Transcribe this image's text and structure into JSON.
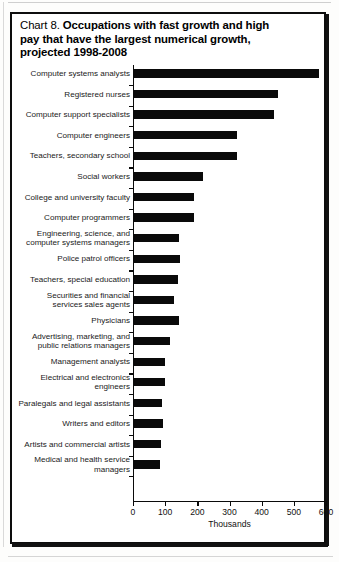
{
  "figure": {
    "chart_number": "Chart 8.",
    "title_lines": [
      "Occupations with fast growth and high",
      "pay that have the largest numerical growth,",
      "projected 1998-2008"
    ],
    "title_full": "Chart 8.  Occupations with fast growth and high pay that have the largest numerical growth, projected 1998-2008"
  },
  "chart_data": {
    "type": "bar",
    "orientation": "horizontal",
    "title": "Occupations with fast growth and high pay that have the largest numerical growth, projected 1998-2008",
    "xlabel": "Thousands",
    "ylabel": "",
    "xlim": [
      0,
      600
    ],
    "xticks": [
      0,
      100,
      200,
      300,
      400,
      500,
      600
    ],
    "xtick_labels": [
      "0",
      "100",
      "200",
      "300",
      "400",
      "500",
      "600"
    ],
    "grid": false,
    "legend": null,
    "bar_color": "#0a0a0a",
    "categories": [
      "Computer systems analysts",
      "Registered nurses",
      "Computer support specialists",
      "Computer engineers",
      "Teachers, secondary school",
      "Social workers",
      "College and university faculty",
      "Computer programmers",
      "Engineering, science, and\ncomputer systems managers",
      "Police patrol officers",
      "Teachers, special education",
      "Securities and financial\nservices sales agents",
      "Physicians",
      "Advertising, marketing, and\npublic relations managers",
      "Management analysts",
      "Electrical and electronics\nengineers",
      "Paralegals and legal assistants",
      "Writers and editors",
      "Artists and commercial artists",
      "Medical and health service\nmanagers"
    ],
    "values": [
      577,
      451,
      439,
      323,
      322,
      217,
      190,
      191,
      144,
      147,
      141,
      129,
      142,
      115,
      101,
      98,
      91,
      92,
      88,
      84
    ]
  },
  "rows": [
    {
      "label": "Computer systems analysts",
      "value": 577,
      "lines": 1
    },
    {
      "label": "Registered nurses",
      "value": 451,
      "lines": 1
    },
    {
      "label": "Computer support specialists",
      "value": 439,
      "lines": 1
    },
    {
      "label": "Computer engineers",
      "value": 323,
      "lines": 1
    },
    {
      "label": "Teachers, secondary school",
      "value": 322,
      "lines": 1
    },
    {
      "label": "Social workers",
      "value": 217,
      "lines": 1
    },
    {
      "label": "College and university faculty",
      "value": 190,
      "lines": 1
    },
    {
      "label": "Computer programmers",
      "value": 191,
      "lines": 1
    },
    {
      "label": "Engineering, science, and\ncomputer systems managers",
      "value": 144,
      "lines": 2
    },
    {
      "label": "Police patrol officers",
      "value": 147,
      "lines": 1
    },
    {
      "label": "Teachers, special education",
      "value": 141,
      "lines": 1
    },
    {
      "label": "Securities and financial\nservices sales agents",
      "value": 129,
      "lines": 2
    },
    {
      "label": "Physicians",
      "value": 142,
      "lines": 1
    },
    {
      "label": "Advertising, marketing, and\npublic relations managers",
      "value": 115,
      "lines": 2
    },
    {
      "label": "Management analysts",
      "value": 101,
      "lines": 1
    },
    {
      "label": "Electrical and electronics\nengineers",
      "value": 98,
      "lines": 2
    },
    {
      "label": "Paralegals and legal assistants",
      "value": 91,
      "lines": 1
    },
    {
      "label": "Writers and editors",
      "value": 92,
      "lines": 1
    },
    {
      "label": "Artists and commercial artists",
      "value": 88,
      "lines": 1
    },
    {
      "label": "Medical and health service\nmanagers",
      "value": 84,
      "lines": 2
    }
  ],
  "axis": {
    "unit_label": "Thousands",
    "ticks": [
      "0",
      "100",
      "200",
      "300",
      "400",
      "500",
      "600"
    ]
  }
}
